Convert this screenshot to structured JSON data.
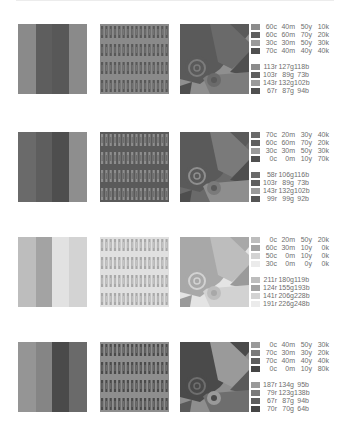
{
  "rows": [
    {
      "stripes": [
        "#8a8a8a",
        "#5e5e5e",
        "#585858",
        "#8a8a8a"
      ],
      "pattern": {
        "bg": "#8a8a8a",
        "bar": "#585858",
        "accent": "#767676"
      },
      "art": {
        "bg": "#8f8f8f",
        "a": "#5a5a5a",
        "b": "#6a6a6a",
        "c": "#7c7c7c",
        "d": "#4f4f4f"
      },
      "cmyk": [
        {
          "swatch": "#8c8c8c",
          "c": "60c",
          "m": "40m",
          "y": "50y",
          "k": "10k"
        },
        {
          "swatch": "#5f5f5f",
          "c": "60c",
          "m": "60m",
          "y": "70y",
          "k": "20k"
        },
        {
          "swatch": "#9a9a9a",
          "c": "30c",
          "m": "30m",
          "y": "50y",
          "k": "30k"
        },
        {
          "swatch": "#505050",
          "c": "70c",
          "m": "40m",
          "y": "40y",
          "k": "40k"
        }
      ],
      "rgb": [
        {
          "swatch": "#8c8c8c",
          "r": "113r",
          "g": "127g",
          "b": "118b"
        },
        {
          "swatch": "#5f5f5f",
          "r": "103r",
          "g": "89g",
          "b": "73b"
        },
        {
          "swatch": "#9a9a9a",
          "r": "143r",
          "g": "132g",
          "b": "102b"
        },
        {
          "swatch": "#505050",
          "r": "67r",
          "g": "87g",
          "b": "94b"
        }
      ]
    },
    {
      "stripes": [
        "#6a6a6a",
        "#5e5e5e",
        "#4e4e4e",
        "#8e8e8e"
      ],
      "pattern": {
        "bg": "#5a5a5a",
        "bar": "#8e8e8e",
        "accent": "#6c6c6c"
      },
      "art": {
        "bg": "#6a6a6a",
        "a": "#5a5a5a",
        "b": "#7a7a7a",
        "c": "#8e8e8e",
        "d": "#4e4e4e"
      },
      "cmyk": [
        {
          "swatch": "#6a6a6a",
          "c": "70c",
          "m": "20m",
          "y": "30y",
          "k": "40k"
        },
        {
          "swatch": "#5f5f5f",
          "c": "60c",
          "m": "60m",
          "y": "70y",
          "k": "20k"
        },
        {
          "swatch": "#9a9a9a",
          "c": "30c",
          "m": "30m",
          "y": "50y",
          "k": "30k"
        },
        {
          "swatch": "#505050",
          "c": "0c",
          "m": "0m",
          "y": "10y",
          "k": "70k"
        }
      ],
      "rgb": [
        {
          "swatch": "#6a6a6a",
          "r": "58r",
          "g": "106g",
          "b": "116b"
        },
        {
          "swatch": "#5f5f5f",
          "r": "103r",
          "g": "89g",
          "b": "73b"
        },
        {
          "swatch": "#9a9a9a",
          "r": "143r",
          "g": "132g",
          "b": "102b"
        },
        {
          "swatch": "#555555",
          "r": "99r",
          "g": "99g",
          "b": "92b"
        }
      ]
    },
    {
      "stripes": [
        "#bdbdbd",
        "#a3a3a3",
        "#e2e2e2",
        "#d3d3d3"
      ],
      "pattern": {
        "bg": "#e0e0e0",
        "bar": "#a8a8a8",
        "accent": "#c4c4c4"
      },
      "art": {
        "bg": "#e4e4e4",
        "a": "#a8a8a8",
        "b": "#bdbdbd",
        "c": "#d2d2d2",
        "d": "#9a9a9a"
      },
      "cmyk": [
        {
          "swatch": "#bdbdbd",
          "c": "0c",
          "m": "20m",
          "y": "50y",
          "k": "20k"
        },
        {
          "swatch": "#a3a3a3",
          "c": "60c",
          "m": "30m",
          "y": "10y",
          "k": "0k"
        },
        {
          "swatch": "#d3d3d3",
          "c": "50c",
          "m": "0m",
          "y": "10y",
          "k": "0k"
        },
        {
          "swatch": "#ebebeb",
          "c": "30c",
          "m": "0m",
          "y": "0y",
          "k": "0k"
        }
      ],
      "rgb": [
        {
          "swatch": "#bdbdbd",
          "r": "211r",
          "g": "180g",
          "b": "119b"
        },
        {
          "swatch": "#a3a3a3",
          "r": "124r",
          "g": "155g",
          "b": "193b"
        },
        {
          "swatch": "#d3d3d3",
          "r": "141r",
          "g": "206g",
          "b": "228b"
        },
        {
          "swatch": "#ebebeb",
          "r": "191r",
          "g": "226g",
          "b": "248b"
        }
      ]
    },
    {
      "stripes": [
        "#959595",
        "#858585",
        "#4a4a4a",
        "#6a6a6a"
      ],
      "pattern": {
        "bg": "#8e8e8e",
        "bar": "#4a4a4a",
        "accent": "#6e6e6e"
      },
      "art": {
        "bg": "#8e8e8e",
        "a": "#4a4a4a",
        "b": "#9a9a9a",
        "c": "#6e6e6e",
        "d": "#5a5a5a"
      },
      "cmyk": [
        {
          "swatch": "#9a9a9a",
          "c": "0c",
          "m": "40m",
          "y": "50y",
          "k": "30k"
        },
        {
          "swatch": "#7a7a7a",
          "c": "70c",
          "m": "30m",
          "y": "30y",
          "k": "20k"
        },
        {
          "swatch": "#5e5e5e",
          "c": "70c",
          "m": "40m",
          "y": "40y",
          "k": "40k"
        },
        {
          "swatch": "#454545",
          "c": "0c",
          "m": "0m",
          "y": "10y",
          "k": "80k"
        }
      ],
      "rgb": [
        {
          "swatch": "#9a9a9a",
          "r": "187r",
          "g": "134g",
          "b": "95b"
        },
        {
          "swatch": "#7a7a7a",
          "r": "79r",
          "g": "123g",
          "b": "138b"
        },
        {
          "swatch": "#5e5e5e",
          "r": "67r",
          "g": "87g",
          "b": "94b"
        },
        {
          "swatch": "#454545",
          "r": "70r",
          "g": "70g",
          "b": "64b"
        }
      ]
    }
  ]
}
